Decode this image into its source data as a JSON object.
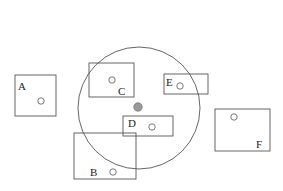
{
  "diagram": {
    "query": {
      "cx": 139,
      "cy": 108,
      "r": 61,
      "color": "#999999"
    },
    "boxes": [
      {
        "label": "A",
        "x": 15,
        "y": 75,
        "w": 41,
        "h": 41,
        "lx": 18,
        "ly": 90,
        "px": 41,
        "py": 101
      },
      {
        "label": "C",
        "x": 89,
        "y": 63,
        "w": 45,
        "h": 34,
        "lx": 118,
        "ly": 95,
        "px": 112,
        "py": 80
      },
      {
        "label": "E",
        "x": 164,
        "y": 74,
        "w": 44,
        "h": 20,
        "lx": 166,
        "ly": 86,
        "px": 180,
        "py": 86
      },
      {
        "label": "D",
        "x": 123,
        "y": 116,
        "w": 50,
        "h": 20,
        "lx": 128,
        "ly": 127,
        "px": 152,
        "py": 127
      },
      {
        "label": "B",
        "x": 74,
        "y": 133,
        "w": 62,
        "h": 46,
        "lx": 90,
        "ly": 176,
        "px": 113,
        "py": 172
      },
      {
        "label": "F",
        "x": 215,
        "y": 109,
        "w": 55,
        "h": 42,
        "lx": 256,
        "ly": 148,
        "px": 234,
        "py": 117
      }
    ]
  }
}
